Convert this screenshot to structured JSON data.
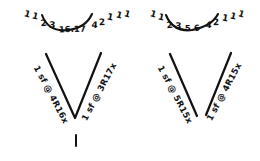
{
  "canvas": {
    "width": 260,
    "height": 161,
    "background": "#ffffff",
    "ink_color": "#111111",
    "medium": "handwritten-pen-sketch"
  },
  "groups": [
    {
      "id": "left-group",
      "top_sequence": {
        "raw": "1 1 2 3 16.17 4 2 1 1 1",
        "tokens": [
          "1",
          "1",
          "2",
          "3",
          "16.17",
          "4",
          "2",
          "1",
          "1",
          "1"
        ],
        "center_value": "16.17"
      },
      "arc": {
        "shape": "concave-up-arc",
        "present": true
      },
      "chevron": {
        "shape": "V",
        "closed_at_vertex": true
      },
      "left_label": {
        "text": "1 sf @ 4R16x",
        "rotation_deg": -62
      },
      "right_label": {
        "text": "1 sf @ 3R17x",
        "rotation_deg": 62
      },
      "vertex_tick": {
        "present": true,
        "orientation": "vertical"
      }
    },
    {
      "id": "right-group",
      "top_sequence": {
        "raw": "1 1 2 3 5.6 4 2 1 1 1",
        "tokens": [
          "1",
          "1",
          "2",
          "3",
          "5.6",
          "4",
          "2",
          "1",
          "1",
          "1"
        ],
        "center_value": "5.6"
      },
      "arc": {
        "shape": "concave-up-arc",
        "present": true
      },
      "chevron": {
        "shape": "open-V",
        "closed_at_vertex": false
      },
      "left_label": {
        "text": "1 sf @ 5R15x",
        "rotation_deg": -62
      },
      "right_label": {
        "text": "1 sf @ 4R15x",
        "rotation_deg": 62
      },
      "vertex_tick": {
        "present": false,
        "orientation": "vertical"
      }
    }
  ]
}
